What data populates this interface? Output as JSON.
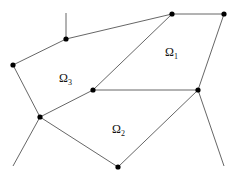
{
  "diagram": {
    "type": "planar-partition",
    "colors": {
      "edge": "#555555",
      "node": "#000000",
      "background": "#ffffff"
    },
    "nodes": [
      {
        "id": "A",
        "x": 66,
        "y": 39
      },
      {
        "id": "B",
        "x": 13,
        "y": 65
      },
      {
        "id": "C",
        "x": 172,
        "y": 14
      },
      {
        "id": "D",
        "x": 224,
        "y": 14
      },
      {
        "id": "E",
        "x": 93,
        "y": 90
      },
      {
        "id": "F",
        "x": 198,
        "y": 90
      },
      {
        "id": "G",
        "x": 40,
        "y": 117
      },
      {
        "id": "H",
        "x": 118,
        "y": 167
      }
    ],
    "regions": [
      {
        "id": "omega1",
        "symbol": "Ω",
        "subscript": "1",
        "x": 166,
        "y": 56
      },
      {
        "id": "omega3",
        "symbol": "Ω",
        "subscript": "3",
        "x": 60,
        "y": 82
      },
      {
        "id": "omega2",
        "symbol": "Ω",
        "subscript": "2",
        "x": 113,
        "y": 133
      }
    ]
  }
}
